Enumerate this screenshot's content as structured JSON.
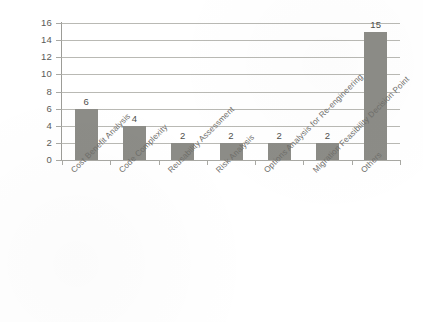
{
  "chart_data": {
    "type": "bar",
    "title": "",
    "xlabel": "",
    "ylabel": "",
    "categories": [
      "Cost Benefit Analysis",
      "Code Complexity",
      "Reusability Assessment",
      "Risk Analysis",
      "Options Analysis for Re-engineering",
      "Migration Feasibility Decision Point",
      "Others"
    ],
    "values": [
      6,
      4,
      2,
      2,
      2,
      2,
      15
    ],
    "value_labels": [
      "6",
      "4",
      "2",
      "2",
      "2",
      "2",
      "15"
    ],
    "ylim": [
      0,
      16
    ],
    "ytick_labels": [
      "0",
      "2",
      "4",
      "6",
      "8",
      "10",
      "12",
      "14",
      "16"
    ],
    "ytick_values": [
      0,
      2,
      4,
      6,
      8,
      10,
      12,
      14,
      16
    ],
    "grid": true,
    "legend": false,
    "legend_position": "none",
    "bar_color": "#8c8c87",
    "gridline_color": "#b9b9b4",
    "axis_color": "#9c9c97",
    "label_color": "#6e6e6a",
    "value_label_color": "#4f4f4c",
    "background_color": "#ffffff",
    "label_rotation_degrees": -45
  }
}
